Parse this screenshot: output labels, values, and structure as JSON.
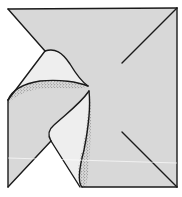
{
  "diagram": {
    "type": "origami-fold-step",
    "description": "Square paper with upper-left corner folded into a squash fold, revealing a curved flap with stippled inner shading",
    "colors": {
      "paper_fill": "#d8d8d8",
      "flap_fill": "#ececec",
      "background": "#ffffff",
      "line": "#1a1a1a",
      "stipple": "#2a2a2a"
    },
    "elements": [
      {
        "name": "paper-square",
        "shape": "square outline with folded top-left corner"
      },
      {
        "name": "crease-top-right",
        "shape": "diagonal from top-right corner toward center"
      },
      {
        "name": "crease-bottom-right",
        "shape": "diagonal from bottom-right corner toward center"
      },
      {
        "name": "crease-top-left",
        "shape": "diagonal from top-left corner to flap apex"
      },
      {
        "name": "upper-flap",
        "shape": "curved triangular flap pointing right"
      },
      {
        "name": "lower-flap",
        "shape": "curved flap pointing up, with stippled right edge"
      },
      {
        "name": "bottom-left-notch",
        "shape": "white triangular notch at bottom-left"
      }
    ]
  }
}
